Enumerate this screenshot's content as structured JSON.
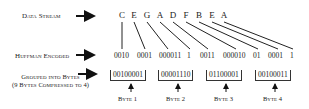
{
  "labels": {
    "data_stream": "Data Stream",
    "huffman_encoded": "Huffman Encoded",
    "grouped_line1": "Grouped into Bytes",
    "grouped_line2": "(9 Bytes Compressed to 4)"
  },
  "data_stream": [
    "C",
    "E",
    "G",
    "A",
    "D",
    "F",
    "B",
    "E",
    "A"
  ],
  "huffman_codes": [
    "0010",
    "0001",
    "000011",
    "1",
    "0011",
    "000010",
    "01",
    "0001",
    "1"
  ],
  "bytes": [
    {
      "value": "00100001",
      "label": "Byte 1"
    },
    {
      "value": "00001110",
      "label": "Byte 2"
    },
    {
      "value": "01100001",
      "label": "Byte 3"
    },
    {
      "value": "00100011",
      "label": "Byte 4"
    }
  ]
}
